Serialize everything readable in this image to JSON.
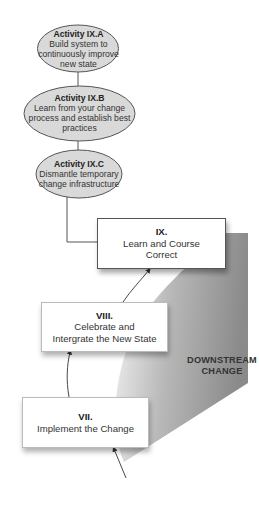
{
  "activities": [
    {
      "title": "Activity IX.A",
      "lines": [
        "Build system to",
        "continuously improve",
        "new state"
      ]
    },
    {
      "title": "Activity IX.B",
      "lines": [
        "Learn from your change",
        "process and establish best",
        "practices"
      ]
    },
    {
      "title": "Activity IX.C",
      "lines": [
        "Dismantle temporary",
        "change infrastructure"
      ]
    }
  ],
  "stages": [
    {
      "numeral": "IX.",
      "lines": [
        "Learn and Course",
        "Correct"
      ]
    },
    {
      "numeral": "VIII.",
      "lines": [
        "Celebrate and",
        "Intergrate the New State"
      ]
    },
    {
      "numeral": "VII.",
      "lines": [
        "Implement the Change"
      ]
    }
  ],
  "zone": {
    "lines": [
      "DOWNSTREAM",
      "CHANGE"
    ]
  },
  "colors": {
    "ellipse_fill": "#d9d9d9",
    "zone_dark": "#8c8c8c",
    "zone_light": "#e6e6e6"
  }
}
